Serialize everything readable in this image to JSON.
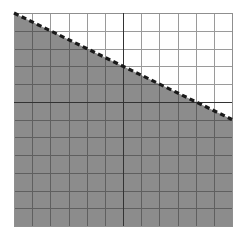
{
  "figure": {
    "background_color": "#ffffff"
  },
  "chart_data": {
    "type": "area",
    "title": "Linear inequality graph",
    "subtitle": "Shaded region below a dashed line on a square coordinate grid",
    "xlabel": "",
    "ylabel": "",
    "xlim": [
      -6,
      6
    ],
    "ylim": [
      -7,
      5
    ],
    "grid": true,
    "grid_step": 1,
    "grid_columns": 12,
    "grid_rows": 12,
    "legend": "none",
    "axes": {
      "x_axis_y_value": 0,
      "y_axis_x_value": 0,
      "x_axis_visible": true,
      "y_axis_visible": true,
      "tick_labels_visible": false,
      "arrowheads": false
    },
    "boundary_line": {
      "style": "dashed",
      "color": "#1a1a1a",
      "slope": -0.5,
      "intercept": 2,
      "equation": "y = -0.5x + 2",
      "endpoints": [
        {
          "x": -6,
          "y": 5
        },
        {
          "x": 6,
          "y": -1
        }
      ],
      "included_in_solution": false
    },
    "shaded_region": {
      "side": "below",
      "inequality": "y < -0.5x + 2",
      "fill_color": "#8c8c8c",
      "opacity": 1
    },
    "series": [
      {
        "name": "boundary",
        "x": [
          -6,
          -5,
          -4,
          -3,
          -2,
          -1,
          0,
          1,
          2,
          3,
          4,
          5,
          6
        ],
        "values": [
          5,
          4.5,
          4,
          3.5,
          3,
          2.5,
          2,
          1.5,
          1,
          0.5,
          0,
          -0.5,
          -1
        ]
      }
    ]
  },
  "styling": {
    "grid_line_color": "#9a9a9a",
    "grid_line_color_shaded": "#5f5f5f",
    "axis_line_color": "#333333",
    "plot_border_color": "#8c8c8c",
    "shade_color": "#8c8c8c",
    "dash_color": "#1c1c1c"
  },
  "geometry": {
    "plot_left": 14,
    "plot_top": 13,
    "plot_right": 232,
    "plot_bottom": 226,
    "cell_width": 18.1667,
    "cell_height": 17.75,
    "origin_x": 123,
    "origin_y": 119.75
  }
}
